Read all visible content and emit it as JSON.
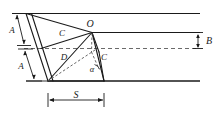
{
  "figure": {
    "type": "geometry-diagram",
    "background_color": "#ffffff",
    "line_color": "#1a1a1a",
    "dashed_color": "#555555",
    "labels": {
      "point_o": "O",
      "point_c_upper": "C",
      "point_c_lower": "C",
      "point_d": "D",
      "angle_alpha": "α",
      "dim_a_upper": "A",
      "dim_a_lower": "A",
      "dim_b": "B",
      "dim_s": "S"
    },
    "guides": {
      "band_lines_count": 3,
      "dashed_lines_count": 1
    }
  }
}
